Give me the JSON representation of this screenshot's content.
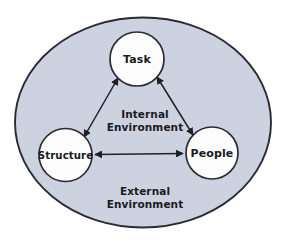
{
  "diagram": {
    "type": "venn-node-diagram",
    "colors": {
      "internal_fill": "#ccd2e0",
      "node_fill": "#fdfdfe",
      "outline": "#2a2a33",
      "arrow": "#1f1f28",
      "text": "#1a1a22",
      "background": "#ffffff"
    },
    "outer_region": {
      "name": "internal-environment-boundary",
      "shape": "ellipse",
      "center": {
        "x": 143,
        "y": 122.5
      },
      "radius": {
        "x": 128,
        "y": 105
      }
    },
    "labels": {
      "internal": {
        "line1": "Internal",
        "line2": "Environment"
      },
      "external": {
        "line1": "External",
        "line2": "Environment"
      }
    },
    "nodes": [
      {
        "id": "task",
        "label": "Task",
        "center": {
          "x": 137,
          "y": 59
        },
        "radius": 27
      },
      {
        "id": "structure",
        "label": "Structure",
        "center": {
          "x": 65.5,
          "y": 155
        },
        "radius": 26.5
      },
      {
        "id": "people",
        "label": "People",
        "center": {
          "x": 212,
          "y": 153
        },
        "radius": 26
      }
    ],
    "connections": [
      {
        "id": "structure-task",
        "from": "structure",
        "to": "task",
        "style": "double-arrow"
      },
      {
        "id": "task-people",
        "from": "task",
        "to": "people",
        "style": "double-arrow"
      },
      {
        "id": "structure-people",
        "from": "structure",
        "to": "people",
        "style": "double-arrow"
      }
    ]
  }
}
